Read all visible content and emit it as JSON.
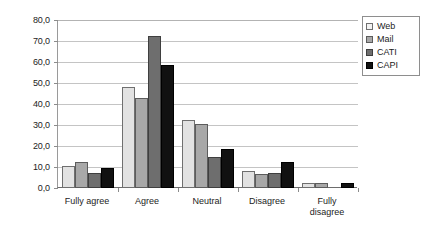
{
  "chart_data": {
    "type": "bar",
    "title": "",
    "xlabel": "",
    "ylabel": "",
    "categories": [
      "Fully agree",
      "Agree",
      "Neutral",
      "Disagree",
      "Fully\ndisagree"
    ],
    "series": [
      {
        "name": "Web",
        "color": "#e2e2e2",
        "values": [
          10.5,
          48.0,
          32.5,
          8.0,
          2.5
        ]
      },
      {
        "name": "Mail",
        "color": "#a8a8a8",
        "values": [
          12.5,
          43.0,
          30.5,
          6.5,
          2.5
        ]
      },
      {
        "name": "CATI",
        "color": "#6e6e6e",
        "values": [
          7.0,
          72.5,
          15.0,
          7.0,
          0.0
        ]
      },
      {
        "name": "CAPI",
        "color": "#111111",
        "values": [
          9.5,
          58.5,
          18.5,
          12.5,
          2.5
        ]
      }
    ],
    "ylim": [
      0,
      80
    ],
    "ytick_values": [
      0,
      10,
      20,
      30,
      40,
      50,
      60,
      70,
      80
    ],
    "ytick_labels": [
      "0,0",
      "10,0",
      "20,0",
      "30,0",
      "40,0",
      "50,0",
      "60,0",
      "70,0",
      "80,0"
    ],
    "grid": true,
    "legend_position": "top-right-outside"
  }
}
